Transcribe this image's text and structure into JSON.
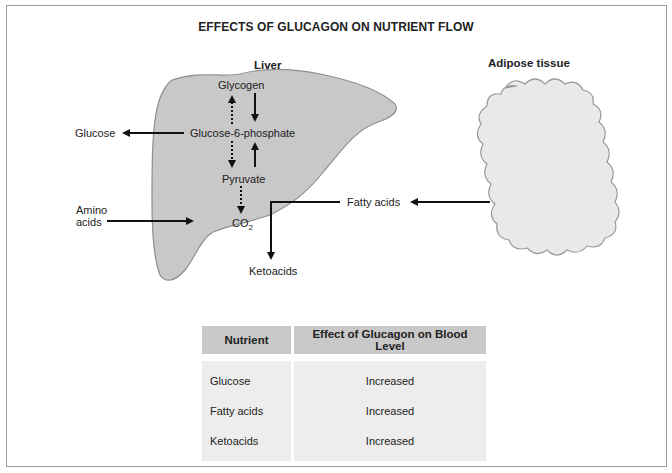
{
  "title": "EFFECTS OF GLUCAGON ON NUTRIENT FLOW",
  "liver": {
    "label": "Liver",
    "metabolites": {
      "glycogen": "Glycogen",
      "g6p": "Glucose-6-phosphate",
      "pyruvate": "Pyruvate",
      "co2_main": "CO",
      "co2_sub": "2"
    }
  },
  "adipose": {
    "label": "Adipose tissue"
  },
  "external": {
    "glucose": "Glucose",
    "amino_line1": "Amino",
    "amino_line2": "acids",
    "fatty_acids": "Fatty acids",
    "ketoacids": "Ketoacids"
  },
  "table": {
    "headers": [
      "Nutrient",
      "Effect of Glucagon on Blood Level"
    ],
    "rows": [
      {
        "nutrient": "Glucose",
        "effect": "Increased"
      },
      {
        "nutrient": "Fatty acids",
        "effect": "Increased"
      },
      {
        "nutrient": "Ketoacids",
        "effect": "Increased"
      }
    ]
  },
  "colors": {
    "organ_fill": "#c8c8c8",
    "adipose_fill": "#e9e9e9",
    "header_fill": "#c9c9c9",
    "cell_fill": "#ededed",
    "frame": "#9a9a9a"
  }
}
